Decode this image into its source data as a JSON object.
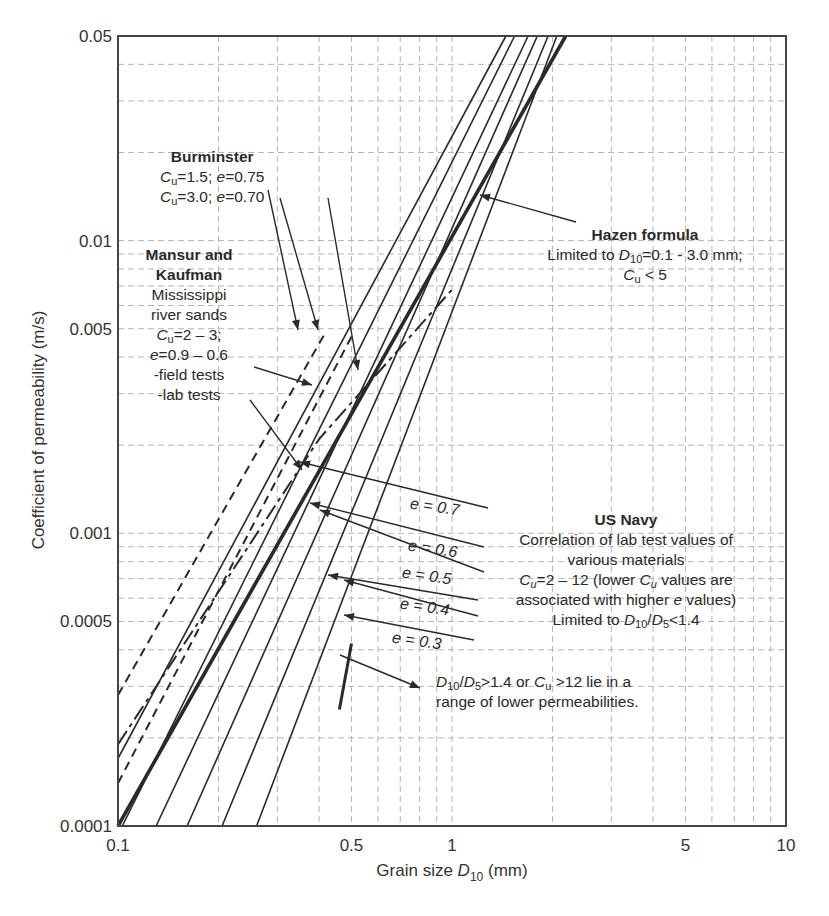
{
  "chart_data": {
    "type": "line",
    "title": "",
    "xlabel": "Grain size D10 (mm)",
    "ylabel": "Coefficient of permeability (m/s)",
    "xscale": "log",
    "yscale": "log",
    "xlim": [
      0.1,
      10
    ],
    "ylim": [
      0.0001,
      0.05
    ],
    "x_ticks": [
      "0.1",
      "0.5",
      "1",
      "5",
      "10"
    ],
    "y_ticks": [
      "0.0001",
      "0.0005",
      "0.001",
      "0.005",
      "0.01",
      "0.05"
    ],
    "grid": true,
    "series": [
      {
        "name": "Hazen formula",
        "style": "solid-thick",
        "x": [
          0.1,
          2.19
        ],
        "y": [
          0.0001,
          0.05
        ]
      },
      {
        "name": "US Navy e = 0.7",
        "style": "solid",
        "x": [
          0.103,
          1.54
        ],
        "y": [
          0.0001,
          0.05
        ]
      },
      {
        "name": "US Navy e = 0.6",
        "style": "solid",
        "x": [
          0.13,
          1.69
        ],
        "y": [
          0.0001,
          0.05
        ]
      },
      {
        "name": "US Navy e = 0.5",
        "style": "solid",
        "x": [
          0.161,
          1.8
        ],
        "y": [
          0.0001,
          0.05
        ]
      },
      {
        "name": "US Navy e = 0.4",
        "style": "solid",
        "x": [
          0.205,
          1.94
        ],
        "y": [
          0.0001,
          0.05
        ]
      },
      {
        "name": "US Navy e = 0.3",
        "style": "solid",
        "x": [
          0.26,
          2.06
        ],
        "y": [
          0.0001,
          0.05
        ]
      },
      {
        "name": "Burminster Cu=1.5; e=0.75",
        "style": "solid",
        "x": [
          0.1,
          1.45
        ],
        "y": [
          0.00017,
          0.05
        ]
      },
      {
        "name": "Burminster Cu=3.0; e=0.70",
        "style": "dashed",
        "x": [
          0.1,
          0.5
        ],
        "y": [
          0.00014,
          0.0047
        ]
      },
      {
        "name": "Mansur and Kaufman field tests",
        "style": "dashed",
        "x": [
          0.1,
          0.42
        ],
        "y": [
          0.00028,
          0.0049
        ]
      },
      {
        "name": "Mansur and Kaufman lab tests",
        "style": "dash-dot",
        "x": [
          0.1,
          0.4,
          1.0
        ],
        "y": [
          0.00019,
          0.0021,
          0.0068
        ]
      },
      {
        "name": "D10/D5 > 1.4 or Cu > 12",
        "style": "solid-short-thick",
        "x": [
          0.46,
          0.5
        ],
        "y": [
          0.00025,
          0.00042
        ]
      }
    ],
    "annotations": [
      "Burminster: Cu = 1.5; e = 0.75 / Cu = 3.0; e = 0.70",
      "Mansur and Kaufman: Mississippi river sands, Cu = 2 - 3; e = 0.9 - 0.6, -field tests, -lab tests",
      "Hazen formula: Limited to D10 = 0.1 - 3.0 mm; Cu < 5",
      "US Navy: Correlation of lab test values of various materials, Cu = 2 - 12 (lower Cu values are associated with higher e values), Limited to D10/D5 < 1.4",
      "D10/D5 > 1.4 or Cu > 12 lie in a range of lower permeabilities."
    ]
  },
  "axes": {
    "x_title_prefix": "Grain size ",
    "x_title_var": "D",
    "x_title_sub": "10",
    "x_title_suffix": " (mm)",
    "y_title": "Coefficient of permeability (m/s)",
    "x_ticks": [
      {
        "label": "0.1",
        "value": 0.1
      },
      {
        "label": "0.5",
        "value": 0.5
      },
      {
        "label": "1",
        "value": 1
      },
      {
        "label": "5",
        "value": 5
      },
      {
        "label": "10",
        "value": 10
      }
    ],
    "y_ticks": [
      {
        "label": "0.05",
        "value": 0.05
      },
      {
        "label": "0.01",
        "value": 0.01
      },
      {
        "label": "0.005",
        "value": 0.005
      },
      {
        "label": "0.001",
        "value": 0.001
      },
      {
        "label": "0.0005",
        "value": 0.0005
      },
      {
        "label": "0.0001",
        "value": 0.0001
      }
    ]
  },
  "labels": {
    "burminster_title": "Burminster",
    "burminster_line1_cu": "=1.5; ",
    "burminster_line1_e": "=0.75",
    "burminster_line2_cu": "=3.0; ",
    "burminster_line2_e": "=0.70",
    "mansur_title1": "Mansur and",
    "mansur_title2": "Kaufman",
    "mansur_l1": "Mississippi",
    "mansur_l2": "river sands",
    "mansur_l3": "=2 – 3;",
    "mansur_l4": "=0.9 – 0.6",
    "mansur_l5": "-field tests",
    "mansur_l6": "-lab tests",
    "hazen_title": "Hazen formula",
    "hazen_l1_pre": "Limited to ",
    "hazen_l1_post": "=0.1 - 3.0 mm;",
    "hazen_l2": "< 5",
    "navy_title": "US Navy",
    "navy_l1": "Correlation of lab test values of",
    "navy_l2": "various materials",
    "navy_l3a": "=2 – 12 (lower ",
    "navy_l3b": " values are",
    "navy_l4a": "associated with higher ",
    "navy_l4b": " values)",
    "navy_l5a": "Limited to ",
    "navy_l5b": "<1.4",
    "note_l1a": ">1.4 or ",
    "note_l1b": " >12 lie in a",
    "note_l2": "range of lower permeabilities.",
    "e07": "e = 0.7",
    "e06": "e = 0.6",
    "e05": "e = 0.5",
    "e04": "e = 0.4",
    "e03": "e = 0.3"
  },
  "colors": {
    "line": "#2a2a2a",
    "grid": "#b5b5b5",
    "axis": "#444444"
  }
}
